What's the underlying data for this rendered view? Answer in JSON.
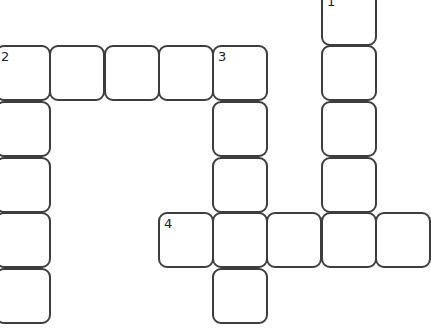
{
  "puzzle": {
    "type": "crossword",
    "cell_size": 56,
    "border_color": "#3d3d3d",
    "background": "#ffffff",
    "cells": [
      {
        "x": 321,
        "y": -10,
        "number": "1"
      },
      {
        "x": 321,
        "y": 45,
        "number": ""
      },
      {
        "x": 321,
        "y": 101,
        "number": ""
      },
      {
        "x": 321,
        "y": 157,
        "number": ""
      },
      {
        "x": -5,
        "y": 45,
        "number": "2"
      },
      {
        "x": 49,
        "y": 45,
        "number": ""
      },
      {
        "x": 104,
        "y": 45,
        "number": ""
      },
      {
        "x": 158,
        "y": 45,
        "number": ""
      },
      {
        "x": 212,
        "y": 45,
        "number": "3"
      },
      {
        "x": -5,
        "y": 101,
        "number": ""
      },
      {
        "x": -5,
        "y": 157,
        "number": ""
      },
      {
        "x": -5,
        "y": 212,
        "number": ""
      },
      {
        "x": -5,
        "y": 268,
        "number": ""
      },
      {
        "x": 212,
        "y": 101,
        "number": ""
      },
      {
        "x": 212,
        "y": 157,
        "number": ""
      },
      {
        "x": 158,
        "y": 212,
        "number": "4"
      },
      {
        "x": 212,
        "y": 212,
        "number": ""
      },
      {
        "x": 266,
        "y": 212,
        "number": ""
      },
      {
        "x": 321,
        "y": 212,
        "number": ""
      },
      {
        "x": 375,
        "y": 212,
        "number": ""
      },
      {
        "x": 212,
        "y": 268,
        "number": ""
      }
    ],
    "words": [
      {
        "number": "1",
        "direction": "down",
        "length": 5
      },
      {
        "number": "2",
        "direction": "across",
        "length": 5
      },
      {
        "number": "2",
        "direction": "down",
        "length": 5
      },
      {
        "number": "3",
        "direction": "down",
        "length": 5
      },
      {
        "number": "4",
        "direction": "across",
        "length": 5
      }
    ]
  }
}
